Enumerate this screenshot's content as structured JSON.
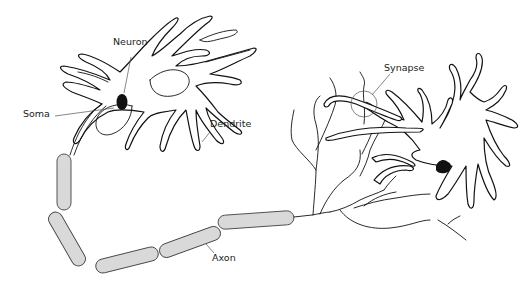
{
  "diagram": {
    "type": "neuron-anatomy",
    "labels": {
      "neuron": "Neuron",
      "soma": "Soma",
      "dendrite": "Dendrite",
      "synapse": "Synapse",
      "axon": "Axon"
    },
    "colors": {
      "outline": "#111111",
      "myelin_fill": "#d9d9d9",
      "nucleus": "#111111",
      "background": "#ffffff"
    }
  }
}
